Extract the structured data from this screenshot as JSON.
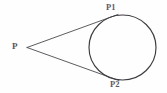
{
  "figure": {
    "background_color": "#fefefe",
    "width": 167,
    "height": 93
  },
  "labels": {
    "external_point": "P",
    "tangent_point_upper": "P1",
    "tangent_point_lower": "P2"
  },
  "chart_data": {
    "type": "diagram",
    "stroke_color": "#4a4a50",
    "circle_color": "#3c3c42",
    "elements": [
      {
        "kind": "circle",
        "name": "circle",
        "cx": 122.5,
        "cy": 47.5,
        "rx": 33.5,
        "ry": 32.5,
        "stroke": "#3c3c42",
        "stroke_width": 1.1,
        "fill": "none"
      },
      {
        "kind": "point",
        "name": "external-point-P",
        "label": "P",
        "x": 27,
        "y": 47.5
      },
      {
        "kind": "point",
        "name": "tangent-point-P1",
        "label": "P1",
        "x": 112,
        "y": 17
      },
      {
        "kind": "point",
        "name": "tangent-point-P2",
        "label": "P2",
        "x": 113,
        "y": 78
      },
      {
        "kind": "line",
        "name": "tangent-line-upper",
        "from": [
          27,
          47.5
        ],
        "to": [
          118,
          14.5
        ],
        "stroke": "#4a4a50",
        "stroke_width": 0.9
      },
      {
        "kind": "line",
        "name": "tangent-line-lower",
        "from": [
          27,
          47.5
        ],
        "to": [
          119,
          80.5
        ],
        "stroke": "#4a4a50",
        "stroke_width": 0.9
      }
    ],
    "xlabel": "",
    "ylabel": "",
    "grid": false,
    "legend": null
  }
}
